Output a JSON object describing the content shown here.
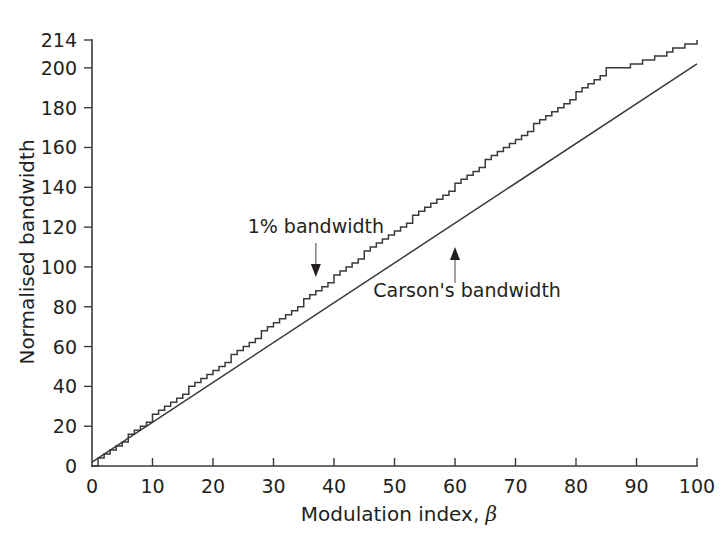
{
  "chart_data": {
    "type": "line",
    "title": "",
    "xlabel": "Modulation index, β",
    "ylabel": "Normalised bandwidth",
    "xlim": [
      0,
      100
    ],
    "ylim": [
      0,
      214
    ],
    "grid": false,
    "legend_position": "none",
    "xticks": [
      0,
      10,
      20,
      30,
      40,
      50,
      60,
      70,
      80,
      90,
      100
    ],
    "xtick_labels": [
      "0",
      "10",
      "20",
      "30",
      "40",
      "50",
      "60",
      "70",
      "80",
      "90",
      "100"
    ],
    "yticks": [
      0,
      20,
      40,
      60,
      80,
      100,
      120,
      140,
      160,
      180,
      200,
      214
    ],
    "ytick_labels": [
      "0",
      "20",
      "40",
      "60",
      "80",
      "100",
      "120",
      "140",
      "160",
      "180",
      "200",
      "214"
    ],
    "series": [
      {
        "name": "1% bandwidth",
        "style": "staircase",
        "x": [
          0,
          2,
          4,
          6,
          8,
          10,
          12,
          14,
          16,
          18,
          20,
          25,
          30,
          35,
          40,
          45,
          50,
          55,
          60,
          65,
          70,
          75,
          80,
          85,
          90,
          95,
          100
        ],
        "values": [
          0,
          6,
          10,
          15,
          20,
          25,
          29,
          34,
          39,
          44,
          48,
          60,
          72,
          83,
          95,
          107,
          118,
          130,
          141,
          153,
          164,
          176,
          187,
          199,
          202,
          208,
          214
        ]
      },
      {
        "name": "Carson's bandwidth",
        "style": "line",
        "x": [
          0,
          100
        ],
        "values": [
          2,
          202
        ]
      }
    ],
    "annotations": [
      {
        "text": "1% bandwidth",
        "label_x": 37,
        "label_y": 117,
        "arrow_from_x": 37,
        "arrow_from_y": 112,
        "arrow_to_x": 37,
        "arrow_to_y": 95,
        "direction": "down"
      },
      {
        "text": "Carson's bandwidth",
        "label_x": 62,
        "label_y": 85,
        "arrow_from_x": 60,
        "arrow_from_y": 92,
        "arrow_to_x": 60,
        "arrow_to_y": 110,
        "direction": "up"
      }
    ],
    "colors": {
      "line": "#3a3a3a",
      "text": "#231f20",
      "background": "#ffffff",
      "arrow": "#6e6e6e"
    }
  }
}
